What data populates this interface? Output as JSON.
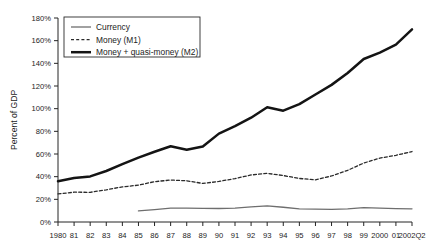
{
  "chart_data": {
    "type": "line",
    "title": "",
    "xlabel": "",
    "ylabel": "Percent of GDP",
    "ylim": [
      0,
      180
    ],
    "ytick_labels": [
      "0%",
      "20%",
      "40%",
      "60%",
      "80%",
      "100%",
      "120%",
      "140%",
      "160%",
      "180%"
    ],
    "ytick_values": [
      0,
      20,
      40,
      60,
      80,
      100,
      120,
      140,
      160,
      180
    ],
    "grid": false,
    "legend_position": "top-left",
    "x": [
      1980,
      1981,
      1982,
      1983,
      1984,
      1985,
      1986,
      1987,
      1988,
      1989,
      1990,
      1991,
      1992,
      1993,
      1994,
      1995,
      1996,
      1997,
      1998,
      1999,
      2000,
      2001,
      2002
    ],
    "categories": [
      "1980",
      "81",
      "82",
      "83",
      "84",
      "85",
      "86",
      "87",
      "88",
      "89",
      "90",
      "91",
      "92",
      "93",
      "94",
      "95",
      "96",
      "97",
      "98",
      "99",
      "2000",
      "01",
      "2002Q2"
    ],
    "series": [
      {
        "name": "Currency",
        "style": "solid-thin",
        "color": "#6e6e6e",
        "start_index": 5,
        "values": [
          null,
          null,
          null,
          null,
          null,
          9.8,
          11.0,
          12.2,
          12.3,
          12.0,
          11.9,
          12.2,
          13.4,
          14.3,
          13.0,
          11.5,
          11.3,
          11.2,
          11.6,
          12.6,
          12.2,
          11.8,
          11.6
        ]
      },
      {
        "name": "Money (M1)",
        "style": "dashed",
        "color": "#2a2a2a",
        "start_index": 0,
        "values": [
          24.8,
          26.3,
          26.2,
          28.4,
          31.0,
          32.5,
          35.6,
          37.0,
          36.4,
          34.0,
          35.8,
          38.3,
          41.5,
          42.9,
          41.0,
          38.4,
          37.2,
          40.6,
          45.6,
          52.0,
          56.4,
          58.8,
          62.2
        ]
      },
      {
        "name": "Money + quasi-money (M2)",
        "style": "solid-thick",
        "color": "#141414",
        "start_index": 0,
        "values": [
          36.0,
          38.8,
          40.2,
          45.0,
          51.0,
          56.8,
          62.0,
          66.8,
          63.8,
          66.6,
          78.0,
          84.5,
          92.0,
          101.2,
          98.2,
          104.0,
          112.5,
          121.0,
          131.5,
          143.8,
          149.5,
          156.5,
          170.0
        ]
      }
    ]
  },
  "legend": {
    "items": [
      {
        "label": "Currency"
      },
      {
        "label": "Money (M1)"
      },
      {
        "label": "Money + quasi-money (M2)"
      }
    ]
  },
  "axes": {
    "y_title": "Percent of GDP"
  }
}
